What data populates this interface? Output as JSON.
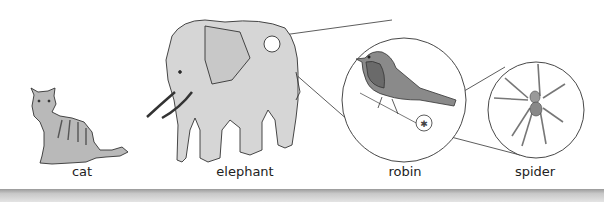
{
  "diagram": {
    "type": "food-chain-illustration",
    "animals": [
      {
        "id": "cat",
        "label": "cat",
        "label_x": 82
      },
      {
        "id": "elephant",
        "label": "elephant",
        "label_x": 245
      },
      {
        "id": "robin",
        "label": "robin",
        "label_x": 405
      },
      {
        "id": "spider",
        "label": "spider",
        "label_x": 535
      }
    ],
    "zoom_callouts": [
      {
        "from": "elephant",
        "to": "robin",
        "description": "robin shown at small scale on elephant's back"
      },
      {
        "from": "robin",
        "to": "spider",
        "description": "spider shown at small scale on branch near robin"
      }
    ]
  }
}
